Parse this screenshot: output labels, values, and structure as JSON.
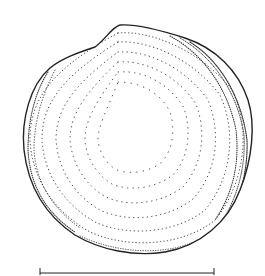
{
  "figure": {
    "background_color": "#ffffff",
    "ink_color": "#222222",
    "scale_bar": {
      "x1": 40,
      "x2": 214,
      "y": 273,
      "label": ""
    }
  }
}
